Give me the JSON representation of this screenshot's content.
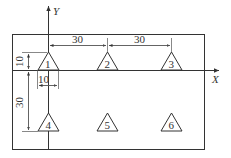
{
  "diagram": {
    "axes": {
      "x_label": "X",
      "y_label": "Y"
    },
    "part_outline": "rectangle",
    "dimensions": {
      "pitch_x_1": "30",
      "pitch_x_2": "30",
      "offset_y": "10",
      "pitch_y": "30",
      "offset_x": "10"
    },
    "holes": [
      {
        "label": "1"
      },
      {
        "label": "2"
      },
      {
        "label": "3"
      },
      {
        "label": "4"
      },
      {
        "label": "5"
      },
      {
        "label": "6"
      }
    ],
    "colors": {
      "line": "#333333",
      "background": "#ffffff"
    }
  }
}
